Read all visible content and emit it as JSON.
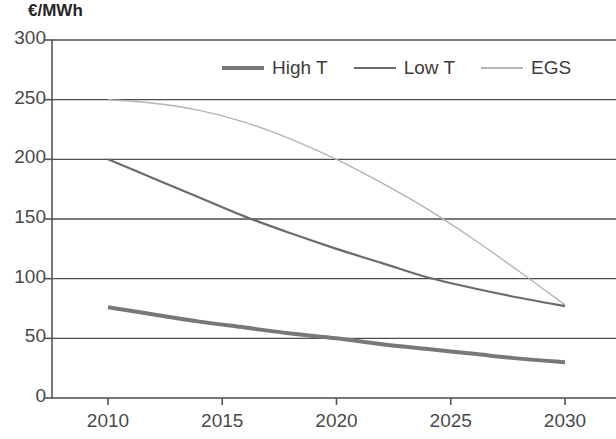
{
  "chart_data": {
    "type": "line",
    "title": "",
    "ylabel": "€/MWh",
    "xlabel": "",
    "ylim": [
      0,
      300
    ],
    "xlim": [
      2010,
      2030
    ],
    "yticks": [
      300,
      250,
      200,
      150,
      100,
      50,
      0
    ],
    "xticks": [
      2010,
      2015,
      2020,
      2025,
      2030
    ],
    "ytick_labels": [
      "300",
      "250",
      "200",
      "150",
      "100",
      "50",
      "0"
    ],
    "xtick_labels": [
      "2010",
      "2015",
      "2020",
      "2025",
      "2030"
    ],
    "grid": "horizontal",
    "legend_position": "top-center",
    "series": [
      {
        "name": "High T",
        "color": "#787878",
        "width": 4.0,
        "x": [
          2010,
          2012,
          2014,
          2016,
          2018,
          2020,
          2022,
          2024,
          2026,
          2028,
          2030
        ],
        "values": [
          76,
          70,
          64,
          59,
          54,
          50,
          45,
          41,
          37,
          33,
          30
        ]
      },
      {
        "name": "Low T",
        "color": "#6b6b6b",
        "width": 2.2,
        "x": [
          2010,
          2012,
          2014,
          2016,
          2018,
          2020,
          2022,
          2024,
          2026,
          2028,
          2030
        ],
        "values": [
          200,
          184,
          168,
          152,
          138,
          125,
          113,
          101,
          92,
          84,
          77
        ]
      },
      {
        "name": "EGS",
        "color": "#b4b4b4",
        "width": 1.4,
        "x": [
          2010,
          2012,
          2014,
          2016,
          2018,
          2020,
          2022,
          2024,
          2026,
          2028,
          2030
        ],
        "values": [
          250,
          247,
          241,
          231,
          217,
          200,
          180,
          158,
          133,
          106,
          78
        ]
      }
    ]
  },
  "legend": {
    "items": [
      {
        "label": "High T",
        "color": "#787878",
        "width": 4.0
      },
      {
        "label": "Low T",
        "color": "#6b6b6b",
        "width": 2.2
      },
      {
        "label": "EGS",
        "color": "#b4b4b4",
        "width": 1.4
      }
    ]
  },
  "colors": {
    "axis": "#555555",
    "grid": "#4d4d4d",
    "background": "#ffffff",
    "text": "#4a4a4a"
  }
}
